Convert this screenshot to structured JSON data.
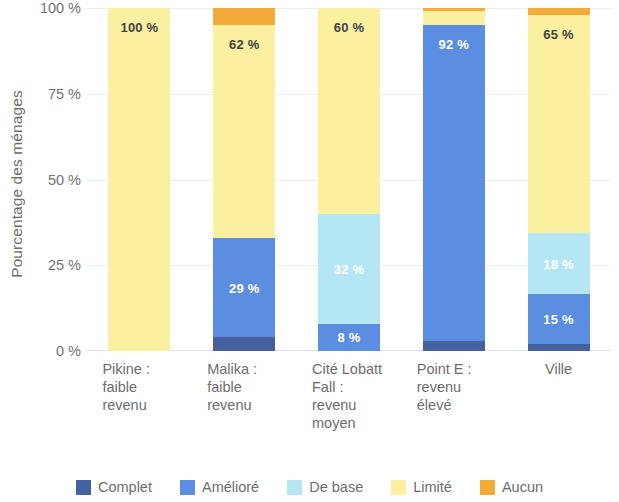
{
  "chart_data": {
    "type": "bar",
    "subtype": "stacked-bar-100-percent",
    "title": "",
    "xlabel": "",
    "ylabel": "Pourcentage des ménages",
    "ylim": [
      0,
      100
    ],
    "y_ticks": [
      "0 %",
      "25 %",
      "50 %",
      "75 %",
      "100 %"
    ],
    "y_tick_values": [
      0,
      25,
      50,
      75,
      100
    ],
    "grid": true,
    "legend_position": "bottom",
    "categories": [
      "Pikine :\nfaible\nrevenu",
      "Malika :\nfaible\nrevenu",
      "Cité Lobatt\nFall :\nrevenu\nmoyen",
      "Point E :\nrevenu\nélevé",
      "Ville"
    ],
    "series": [
      {
        "name": "Complet",
        "color": "#46619f",
        "values": [
          0,
          4,
          0,
          3,
          2
        ]
      },
      {
        "name": "Amélioré",
        "color": "#5b8ee0",
        "values": [
          0,
          29,
          8,
          92,
          15
        ]
      },
      {
        "name": "De base",
        "color": "#b5e6f4",
        "values": [
          0,
          0,
          32,
          0,
          18
        ]
      },
      {
        "name": "Limité",
        "color": "#faf0a0",
        "values": [
          100,
          62,
          60,
          4,
          65
        ]
      },
      {
        "name": "Aucun",
        "color": "#f5ab3a",
        "values": [
          0,
          5,
          0,
          1,
          2
        ]
      }
    ],
    "data_labels": [
      {
        "text": "100 %",
        "color": "#444444"
      },
      {
        "text": "62 %",
        "color": "#444444"
      },
      {
        "text": "29 %",
        "color": "#ffffff"
      },
      {
        "text": "60 %",
        "color": "#444444"
      },
      {
        "text": "32 %",
        "color": "#ffffff"
      },
      {
        "text": "8 %",
        "color": "#ffffff"
      },
      {
        "text": "92 %",
        "color": "#ffffff"
      },
      {
        "text": "65 %",
        "color": "#444444"
      },
      {
        "text": "18 %",
        "color": "#ffffff"
      },
      {
        "text": "15 %",
        "color": "#ffffff"
      }
    ]
  },
  "axis": {
    "y_title": "Pourcentage des ménages",
    "ticks": [
      {
        "label": "100 %",
        "value": 100
      },
      {
        "label": "75 %",
        "value": 75
      },
      {
        "label": "50 %",
        "value": 50
      },
      {
        "label": "25 %",
        "value": 25
      },
      {
        "label": "0 %",
        "value": 0
      }
    ]
  },
  "bars": [
    {
      "category_lines": [
        "Pikine :",
        "faible",
        "revenu"
      ],
      "segments": [
        {
          "series": "Limité",
          "value": 100,
          "color": "#faf0a0",
          "label": "100 %",
          "label_color": "#444444",
          "label_anchor": "top"
        }
      ]
    },
    {
      "category_lines": [
        "Malika :",
        "faible",
        "revenu"
      ],
      "segments": [
        {
          "series": "Complet",
          "value": 4,
          "color": "#46619f",
          "label": "",
          "label_color": "#ffffff",
          "label_anchor": "center"
        },
        {
          "series": "Amélioré",
          "value": 29,
          "color": "#5b8ee0",
          "label": "29 %",
          "label_color": "#ffffff",
          "label_anchor": "center"
        },
        {
          "series": "Limité",
          "value": 62,
          "color": "#faf0a0",
          "label": "62 %",
          "label_color": "#444444",
          "label_anchor": "top"
        },
        {
          "series": "Aucun",
          "value": 5,
          "color": "#f5ab3a",
          "label": "",
          "label_color": "#ffffff",
          "label_anchor": "center"
        }
      ]
    },
    {
      "category_lines": [
        "Cité Lobatt",
        "Fall :",
        "revenu",
        "moyen"
      ],
      "segments": [
        {
          "series": "Amélioré",
          "value": 8,
          "color": "#5b8ee0",
          "label": "8 %",
          "label_color": "#ffffff",
          "label_anchor": "center"
        },
        {
          "series": "De base",
          "value": 32,
          "color": "#b5e6f4",
          "label": "32 %",
          "label_color": "#ffffff",
          "label_anchor": "center"
        },
        {
          "series": "Limité",
          "value": 60,
          "color": "#faf0a0",
          "label": "60 %",
          "label_color": "#444444",
          "label_anchor": "top"
        }
      ]
    },
    {
      "category_lines": [
        "Point E :",
        "revenu",
        "élevé"
      ],
      "segments": [
        {
          "series": "Complet",
          "value": 3,
          "color": "#46619f",
          "label": "",
          "label_color": "#ffffff",
          "label_anchor": "center"
        },
        {
          "series": "Amélioré",
          "value": 92,
          "color": "#5b8ee0",
          "label": "92 %",
          "label_color": "#ffffff",
          "label_anchor": "top"
        },
        {
          "series": "Limité",
          "value": 4,
          "color": "#faf0a0",
          "label": "",
          "label_color": "#444444",
          "label_anchor": "center"
        },
        {
          "series": "Aucun",
          "value": 1,
          "color": "#f5ab3a",
          "label": "",
          "label_color": "#ffffff",
          "label_anchor": "center"
        }
      ]
    },
    {
      "category_lines": [
        "Ville"
      ],
      "segments": [
        {
          "series": "Complet",
          "value": 2,
          "color": "#46619f",
          "label": "",
          "label_color": "#ffffff",
          "label_anchor": "center"
        },
        {
          "series": "Amélioré",
          "value": 15,
          "color": "#5b8ee0",
          "label": "15 %",
          "label_color": "#ffffff",
          "label_anchor": "center"
        },
        {
          "series": "De base",
          "value": 18,
          "color": "#b5e6f4",
          "label": "18 %",
          "label_color": "#ffffff",
          "label_anchor": "center"
        },
        {
          "series": "Limité",
          "value": 65,
          "color": "#faf0a0",
          "label": "65 %",
          "label_color": "#444444",
          "label_anchor": "top"
        },
        {
          "series": "Aucun",
          "value": 2,
          "color": "#f5ab3a",
          "label": "",
          "label_color": "#ffffff",
          "label_anchor": "center"
        }
      ]
    }
  ],
  "legend": {
    "items": [
      {
        "label": "Complet",
        "color": "#46619f"
      },
      {
        "label": "Amélioré",
        "color": "#5b8ee0"
      },
      {
        "label": "De base",
        "color": "#b5e6f4"
      },
      {
        "label": "Limité",
        "color": "#faf0a0"
      },
      {
        "label": "Aucun",
        "color": "#f5ab3a"
      }
    ]
  }
}
